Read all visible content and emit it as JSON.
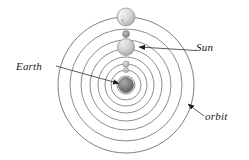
{
  "diagram": {
    "background_color": "#ffffff",
    "line_color": "#6b6b6b",
    "leader_color": "#4a4a4a",
    "text_color": "#1a1a1a",
    "center": {
      "x": 126,
      "y": 85
    },
    "labels": [
      {
        "id": "earth",
        "text": "Earth",
        "style": "italic"
      },
      {
        "id": "sun",
        "text": "Sun",
        "style": "italic"
      },
      {
        "id": "orbit",
        "text": "orbit",
        "style": "italic"
      }
    ],
    "orbits": [
      {
        "index": 1,
        "radius": 9
      },
      {
        "index": 2,
        "radius": 15
      },
      {
        "index": 3,
        "radius": 21
      },
      {
        "index": 4,
        "radius": 28
      },
      {
        "index": 5,
        "radius": 36
      },
      {
        "index": 6,
        "radius": 45
      },
      {
        "index": 7,
        "radius": 56
      },
      {
        "index": 8,
        "radius": 68
      }
    ],
    "bodies": [
      {
        "id": "earth-body",
        "name": "Earth",
        "cx": 126,
        "cy": 85,
        "r": 7.5,
        "fill": "#7a7a7a",
        "shaded": true
      },
      {
        "id": "body-inner-1",
        "name": "inner body",
        "cx": 126,
        "cy": 70,
        "r": 2.6,
        "fill": "#a8a8a8",
        "shaded": true
      },
      {
        "id": "body-inner-2",
        "name": "inner body",
        "cx": 126,
        "cy": 64,
        "r": 3.2,
        "fill": "#b5b5b5",
        "shaded": true
      },
      {
        "id": "sun-body",
        "name": "Sun",
        "cx": 126,
        "cy": 47,
        "r": 8.5,
        "fill": "#cccccc",
        "shaded": true
      },
      {
        "id": "body-outer-small",
        "name": "small body",
        "cx": 126,
        "cy": 34,
        "r": 3.4,
        "fill": "#8a8a8a",
        "shaded": true
      },
      {
        "id": "moon-body",
        "name": "outer moon",
        "cx": 126,
        "cy": 17,
        "r": 9.0,
        "fill": "#d2d2d2",
        "shaded": true
      }
    ],
    "leaders": [
      {
        "id": "earth-leader",
        "from": {
          "x": 56,
          "y": 66
        },
        "to": {
          "x": 117,
          "y": 84
        },
        "arrow": true
      },
      {
        "id": "sun-leader",
        "from": {
          "x": 194,
          "y": 50
        },
        "to": {
          "x": 137,
          "y": 47
        },
        "arrow": true
      },
      {
        "id": "orbit-leader",
        "from": {
          "x": 203,
          "y": 115
        },
        "to": {
          "x": 186,
          "y": 103
        },
        "arrow": true
      }
    ]
  }
}
